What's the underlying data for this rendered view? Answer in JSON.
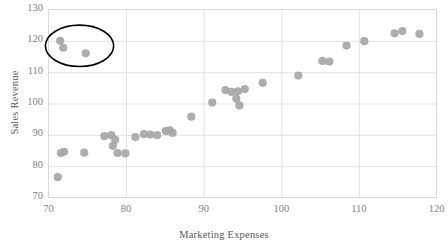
{
  "chart_data": {
    "type": "scatter",
    "title": "",
    "xlabel": "Marketing Expenses",
    "ylabel": "Sales Revenue",
    "xlim": [
      70,
      120
    ],
    "ylim": [
      70,
      130
    ],
    "xticks": [
      70,
      80,
      90,
      100,
      110,
      120
    ],
    "yticks": [
      70,
      80,
      90,
      100,
      110,
      120,
      130
    ],
    "grid": true,
    "legend": null,
    "marker_color": "#a6a6a6",
    "annotation_color": "#000000",
    "series": [
      {
        "name": "Sales vs Marketing",
        "points": [
          [
            71.2,
            76.5
          ],
          [
            71.6,
            84.2
          ],
          [
            72.0,
            84.6
          ],
          [
            74.6,
            84.3
          ],
          [
            77.2,
            89.6
          ],
          [
            78.1,
            89.9
          ],
          [
            78.3,
            86.5
          ],
          [
            78.6,
            88.4
          ],
          [
            78.9,
            84.2
          ],
          [
            79.9,
            84.1
          ],
          [
            81.2,
            89.3
          ],
          [
            82.3,
            90.2
          ],
          [
            83.1,
            90.1
          ],
          [
            84.0,
            89.9
          ],
          [
            85.1,
            91.2
          ],
          [
            85.6,
            91.4
          ],
          [
            86.0,
            90.6
          ],
          [
            88.4,
            95.8
          ],
          [
            91.1,
            100.3
          ],
          [
            92.8,
            104.3
          ],
          [
            93.6,
            103.7
          ],
          [
            94.2,
            101.5
          ],
          [
            94.4,
            103.9
          ],
          [
            94.6,
            99.4
          ],
          [
            95.3,
            104.6
          ],
          [
            97.6,
            106.6
          ],
          [
            102.2,
            108.9
          ],
          [
            105.3,
            113.6
          ],
          [
            106.2,
            113.4
          ],
          [
            108.4,
            118.5
          ],
          [
            110.7,
            119.9
          ],
          [
            114.6,
            122.4
          ],
          [
            115.6,
            123.1
          ],
          [
            117.8,
            122.2
          ],
          [
            71.5,
            120.0
          ],
          [
            71.9,
            117.8
          ],
          [
            74.8,
            116.0
          ]
        ]
      }
    ],
    "annotations": [
      {
        "kind": "ellipse",
        "label": "outlier-circle",
        "center_x": 74.0,
        "center_y": 118.4,
        "radius_x": 4.4,
        "radius_y": 6.6,
        "stroke": "#000000",
        "stroke_width": 1.6
      }
    ]
  },
  "axes": {
    "y_title": "Sales Revenue",
    "x_title": "Marketing Expenses",
    "y_tick_labels": [
      "130",
      "120",
      "110",
      "100",
      "90",
      "80",
      "70"
    ],
    "x_tick_labels": [
      "70",
      "80",
      "90",
      "100",
      "110",
      "120"
    ]
  }
}
